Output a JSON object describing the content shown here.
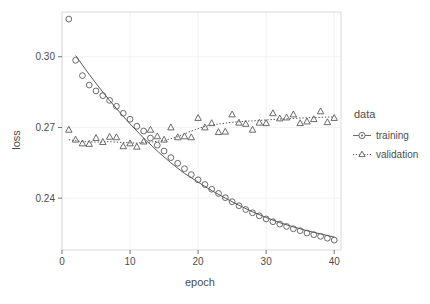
{
  "chart_data": {
    "type": "scatter",
    "title": "",
    "xlabel": "epoch",
    "ylabel": "loss",
    "xlim": [
      0,
      41
    ],
    "ylim": [
      0.218,
      0.319
    ],
    "xticks": [
      0,
      10,
      20,
      30,
      40
    ],
    "xtick_labels": [
      "0",
      "10",
      "20",
      "30",
      "40"
    ],
    "yticks": [
      0.24,
      0.27,
      0.3
    ],
    "ytick_labels": [
      "0.24",
      "0.27",
      "0.30"
    ],
    "grid": true,
    "legend_position": "right",
    "legend_title": "data",
    "x": [
      1,
      2,
      3,
      4,
      5,
      6,
      7,
      8,
      9,
      10,
      11,
      12,
      13,
      14,
      15,
      16,
      17,
      18,
      19,
      20,
      21,
      22,
      23,
      24,
      25,
      26,
      27,
      28,
      29,
      30,
      31,
      32,
      33,
      34,
      35,
      36,
      37,
      38,
      39,
      40
    ],
    "series": [
      {
        "name": "training",
        "marker": "circle",
        "line": "solid",
        "color": "#595959",
        "values": [
          0.316,
          0.2985,
          0.292,
          0.288,
          0.2855,
          0.2835,
          0.2815,
          0.279,
          0.276,
          0.2735,
          0.2705,
          0.2685,
          0.2655,
          0.2625,
          0.26,
          0.2572,
          0.2548,
          0.2525,
          0.25,
          0.2478,
          0.2458,
          0.2438,
          0.242,
          0.2402,
          0.2385,
          0.2368,
          0.2352,
          0.2338,
          0.2325,
          0.2312,
          0.23,
          0.229,
          0.228,
          0.227,
          0.2262,
          0.2252,
          0.2245,
          0.2238,
          0.223,
          0.2222
        ]
      },
      {
        "name": "validation",
        "marker": "triangle",
        "line": "dotted",
        "color": "#595959",
        "values": [
          0.269,
          0.2648,
          0.2632,
          0.263,
          0.2655,
          0.2638,
          0.266,
          0.2658,
          0.262,
          0.2632,
          0.2618,
          0.264,
          0.269,
          0.2662,
          0.2648,
          0.27,
          0.2658,
          0.2662,
          0.2658,
          0.274,
          0.27,
          0.2718,
          0.268,
          0.2682,
          0.2755,
          0.272,
          0.2715,
          0.269,
          0.272,
          0.2718,
          0.276,
          0.2738,
          0.2742,
          0.2755,
          0.2718,
          0.2725,
          0.2735,
          0.2768,
          0.2722,
          0.274
        ]
      }
    ],
    "trend_lines": [
      {
        "series": "training",
        "style": "solid",
        "points": [
          [
            2,
            0.3005
          ],
          [
            4,
            0.2925
          ],
          [
            6,
            0.285
          ],
          [
            8,
            0.278
          ],
          [
            10,
            0.2715
          ],
          [
            12,
            0.2655
          ],
          [
            14,
            0.26
          ],
          [
            16,
            0.255
          ],
          [
            18,
            0.2505
          ],
          [
            20,
            0.2468
          ],
          [
            22,
            0.2432
          ],
          [
            24,
            0.24
          ],
          [
            26,
            0.237
          ],
          [
            28,
            0.2342
          ],
          [
            30,
            0.2318
          ],
          [
            32,
            0.2296
          ],
          [
            34,
            0.2278
          ],
          [
            36,
            0.2262
          ],
          [
            38,
            0.2248
          ],
          [
            40,
            0.2235
          ]
        ]
      },
      {
        "series": "validation",
        "style": "dotted",
        "points": [
          [
            1,
            0.2648
          ],
          [
            3,
            0.264
          ],
          [
            5,
            0.2638
          ],
          [
            7,
            0.264
          ],
          [
            9,
            0.2636
          ],
          [
            11,
            0.2634
          ],
          [
            13,
            0.2638
          ],
          [
            15,
            0.2645
          ],
          [
            17,
            0.266
          ],
          [
            19,
            0.2685
          ],
          [
            21,
            0.2705
          ],
          [
            23,
            0.2715
          ],
          [
            25,
            0.2722
          ],
          [
            27,
            0.2726
          ],
          [
            29,
            0.273
          ],
          [
            31,
            0.2734
          ],
          [
            33,
            0.2737
          ],
          [
            35,
            0.274
          ],
          [
            37,
            0.2742
          ],
          [
            40,
            0.2745
          ]
        ]
      }
    ]
  },
  "legend": {
    "title": "data",
    "entries": [
      {
        "label": "training",
        "marker": "circle",
        "line": "solid"
      },
      {
        "label": "validation",
        "marker": "triangle",
        "line": "dotted"
      }
    ]
  },
  "axes": {
    "x_title": "epoch",
    "y_title": "loss"
  },
  "colors": {
    "ink": "#4d4d4d",
    "marker": "#595959",
    "panel_background": "#ffffff",
    "grid": "#f2f2f2",
    "axis_line": "#d9d9d9"
  }
}
